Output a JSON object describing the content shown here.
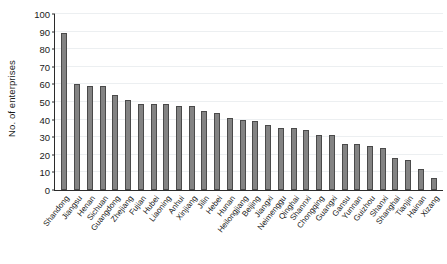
{
  "chart_data": {
    "type": "bar",
    "title": "",
    "xlabel": "",
    "ylabel": "No. of enterprises",
    "ylim": [
      0,
      100
    ],
    "yticks": [
      0,
      10,
      20,
      30,
      40,
      50,
      60,
      70,
      80,
      90,
      100
    ],
    "grid": true,
    "legend": null,
    "bar_color": "#838383",
    "bar_edge_color": "#4a4a4a",
    "categories": [
      "Shandong",
      "Jiangsu",
      "Henan",
      "Sichuan",
      "Guangdong",
      "Zhejiang",
      "Fujian",
      "Hubei",
      "Liaoning",
      "Anhui",
      "Xinjiang",
      "Jilin",
      "Hebei",
      "Hunan",
      "Heilongjiang",
      "Beijing",
      "Jiangxi",
      "Neimenggu",
      "Qinghai",
      "Shannxi",
      "Chongqing",
      "Guangxi",
      "Gansu",
      "Yunnan",
      "Guizhou",
      "Shanxi",
      "Shanghai",
      "Tianjin",
      "Hainan",
      "Xizang"
    ],
    "values": [
      89,
      60,
      59,
      59,
      54,
      51,
      49,
      49,
      49,
      48,
      48,
      45,
      44,
      41,
      40,
      39,
      37,
      35,
      35,
      34,
      31,
      31,
      26,
      26,
      25,
      24,
      18,
      17,
      12,
      7
    ]
  }
}
